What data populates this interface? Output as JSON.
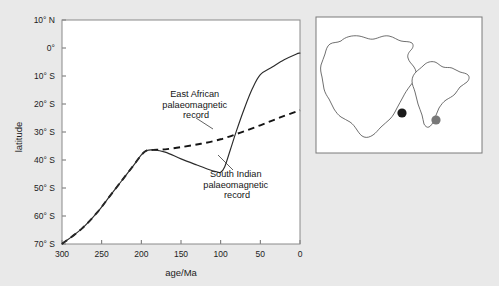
{
  "figure": {
    "background_color": "#e9e9e9",
    "panel_color": "#ffffff"
  },
  "chart_data": {
    "type": "line",
    "title": "",
    "xlabel": "age/Ma",
    "ylabel": "latitude",
    "xlim": [
      300,
      0
    ],
    "ylim": [
      -70,
      10
    ],
    "x_ticks": [
      300,
      250,
      200,
      150,
      100,
      50,
      0
    ],
    "x_tick_labels": [
      "300",
      "250",
      "200",
      "150",
      "100",
      "50",
      "0"
    ],
    "y_ticks": [
      10,
      0,
      -10,
      -20,
      -30,
      -40,
      -50,
      -60,
      -70
    ],
    "y_tick_labels": [
      "10° N",
      "0°",
      "10° S",
      "20° S",
      "30° S",
      "40° S",
      "50° S",
      "60° S",
      "70° S"
    ],
    "grid": false,
    "legend_position": "inline-annotations",
    "series": [
      {
        "name": "East African palaeomagnetic record",
        "style": "dashed",
        "color": "#141414",
        "x": [
          300,
          275,
          255,
          240,
          225,
          210,
          200,
          193,
          185,
          170,
          150,
          125,
          100,
          75,
          50,
          25,
          0
        ],
        "y": [
          -70,
          -64.5,
          -58.5,
          -53,
          -47.5,
          -42,
          -38.2,
          -36.6,
          -36.4,
          -36.2,
          -35.4,
          -34.2,
          -32.6,
          -30.2,
          -27.6,
          -24.8,
          -22.2
        ]
      },
      {
        "name": "South Indian palaeomagnetic record",
        "style": "solid",
        "color": "#2b2b2b",
        "x": [
          300,
          275,
          255,
          240,
          225,
          210,
          200,
          193,
          185,
          170,
          150,
          130,
          115,
          105,
          100,
          95,
          88,
          80,
          70,
          60,
          50,
          35,
          20,
          5,
          0
        ],
        "y": [
          -70,
          -64.5,
          -58.5,
          -53,
          -47.5,
          -42,
          -38.2,
          -36.6,
          -36.4,
          -37.2,
          -39.6,
          -41.8,
          -43.4,
          -44.2,
          -44.4,
          -42.5,
          -36.5,
          -29.5,
          -21.5,
          -14.5,
          -9.5,
          -6.8,
          -4.2,
          -2.2,
          -1.8
        ]
      }
    ],
    "annotations": [
      {
        "id": "east-african-annotation",
        "lines": [
          "East African",
          "palaeomagnetic",
          "record"
        ],
        "text_anchor_px": [
          196,
          97
        ],
        "leader_from_px": [
          196,
          118
        ],
        "leader_to_px": [
          213,
          129
        ]
      },
      {
        "id": "south-indian-annotation",
        "lines": [
          "South Indian",
          "palaeomagnetic",
          "record"
        ],
        "text_anchor_px": [
          237,
          177
        ],
        "leader_from_px": [
          233,
          170
        ],
        "leader_to_px": [
          218,
          155
        ]
      }
    ]
  },
  "inset_map": {
    "name": "locality-map",
    "frame_color": "#7a7a7a",
    "landmasses": [
      {
        "name": "africa-outline",
        "label": "Africa"
      },
      {
        "name": "india-outline",
        "label": "India"
      }
    ],
    "markers": [
      {
        "name": "east-african-site-marker",
        "color": "#1a1a1a",
        "label": "East African site"
      },
      {
        "name": "south-indian-site-marker",
        "color": "#787878",
        "label": "South Indian site"
      }
    ]
  }
}
